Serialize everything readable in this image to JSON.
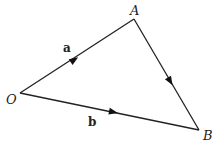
{
  "diagram": {
    "type": "vector-triangle",
    "vertices": [
      {
        "id": "O",
        "label": "O",
        "x": 20,
        "y": 93
      },
      {
        "id": "A",
        "label": "A",
        "x": 134,
        "y": 19
      },
      {
        "id": "B",
        "label": "B",
        "x": 199,
        "y": 130
      }
    ],
    "edges": [
      {
        "from": "O",
        "to": "A",
        "label": "a",
        "directed": true
      },
      {
        "from": "O",
        "to": "B",
        "label": "b",
        "directed": true
      },
      {
        "from": "A",
        "to": "B",
        "label": "",
        "directed": true
      }
    ]
  },
  "labels": {
    "vertex_O": "O",
    "vertex_A": "A",
    "vertex_B": "B",
    "vector_a": "a",
    "vector_b": "b"
  },
  "colors": {
    "stroke": "#222222",
    "background": "#ffffff"
  }
}
